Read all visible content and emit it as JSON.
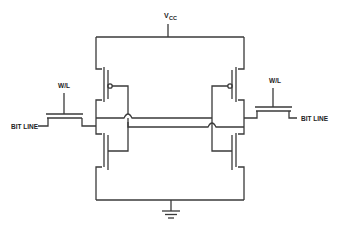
{
  "diagram": {
    "type": "circuit-schematic",
    "labels": {
      "vcc_main": "V",
      "vcc_sub": "CC",
      "wl_left": "W/L",
      "wl_right": "W/L",
      "bitline_left": "BIT LINE",
      "bitline_right": "BIT LINE"
    },
    "components": [
      {
        "id": "pmos-left",
        "type": "PMOS"
      },
      {
        "id": "nmos-left",
        "type": "NMOS"
      },
      {
        "id": "pmos-right",
        "type": "PMOS"
      },
      {
        "id": "nmos-right",
        "type": "NMOS"
      },
      {
        "id": "access-left",
        "type": "NMOS pass transistor"
      },
      {
        "id": "access-right",
        "type": "NMOS pass transistor"
      },
      {
        "id": "ground",
        "type": "ground"
      }
    ],
    "colors": {
      "line": "#3a3a3a",
      "background": "#ffffff"
    }
  }
}
